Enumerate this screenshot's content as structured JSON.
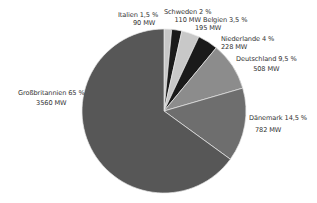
{
  "chart_data": {
    "type": "pie",
    "title": "",
    "start_angle_deg": 0,
    "direction": "clockwise",
    "center": [
      164,
      111
    ],
    "radius": 82,
    "categories": [
      "Italien",
      "Schweden",
      "Belgien",
      "Niederlande",
      "Deutschland",
      "Dänemark",
      "Großbritannien"
    ],
    "values_percent": [
      1.5,
      2,
      3.5,
      4,
      9.5,
      14.5,
      65
    ],
    "values_mw": [
      90,
      110,
      195,
      228,
      508,
      782,
      3560
    ],
    "colors": [
      "#c8c8c8",
      "#1a1a1a",
      "#c8c8c8",
      "#1a1a1a",
      "#8c8c8c",
      "#6e6e6e",
      "#575757"
    ],
    "separator_color": "#e6e6e6",
    "slices": [
      {
        "name": "Italien",
        "pct_label": "Italien 1,5 %",
        "mw_label": "90 MW"
      },
      {
        "name": "Schweden",
        "pct_label": "Schweden 2 %",
        "mw_label": "110 MW"
      },
      {
        "name": "Belgien",
        "pct_label": "Belgien 3,5 %",
        "mw_label": "195 MW"
      },
      {
        "name": "Niederlande",
        "pct_label": "Niederlande 4 %",
        "mw_label": "228 MW"
      },
      {
        "name": "Deutschland",
        "pct_label": "Deutschland 9,5 %",
        "mw_label": "508 MW"
      },
      {
        "name": "Dänemark",
        "pct_label": "Dänemark 14,5 %",
        "mw_label": "782 MW"
      },
      {
        "name": "Großbritannien",
        "pct_label": "Großbritannien 65 %",
        "mw_label": "3560 MW"
      }
    ],
    "legend": "none"
  }
}
